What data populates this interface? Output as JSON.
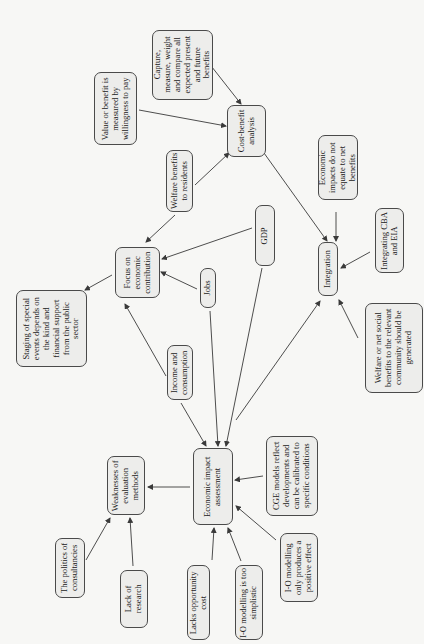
{
  "diagram": {
    "orientation": "rotated-90-ccw",
    "nodes": [
      {
        "id": "capture",
        "label": "Capture, measure, weight and compare all expected present and future benefits",
        "box": [
          152,
          30,
          61,
          70
        ],
        "textw": 62
      },
      {
        "id": "value",
        "label": "Value or benefit is measured by willingness to pay",
        "box": [
          94,
          72,
          43,
          73
        ],
        "textw": 68
      },
      {
        "id": "cba",
        "label": "Cost-benefit analysis",
        "box": [
          227,
          105,
          39,
          52
        ],
        "textw": 46
      },
      {
        "id": "welfare-res",
        "label": "Welfare benefits to residents",
        "box": [
          166,
          150,
          27,
          62
        ],
        "textw": 58
      },
      {
        "id": "econ-impacts",
        "label": "Economic impacts do not equate to net benefits",
        "box": [
          318,
          135,
          40,
          65
        ],
        "textw": 60
      },
      {
        "id": "integrating",
        "label": "Integrating CBA and EIA",
        "box": [
          375,
          208,
          29,
          65
        ],
        "textw": 58
      },
      {
        "id": "gdp",
        "label": "GDP",
        "box": [
          255,
          205,
          20,
          61
        ],
        "textw": 40
      },
      {
        "id": "integration",
        "label": "Integration",
        "box": [
          318,
          242,
          20,
          54
        ],
        "textw": 50
      },
      {
        "id": "focus",
        "label": "Focus on economic contribution",
        "box": [
          115,
          247,
          45,
          51
        ],
        "textw": 48
      },
      {
        "id": "jobs",
        "label": "Jobs",
        "box": [
          200,
          268,
          16,
          40
        ],
        "textw": 36
      },
      {
        "id": "staging",
        "label": "Staging of special events depends on the kind and financial support from the public sector",
        "box": [
          16,
          290,
          71,
          77
        ],
        "textw": 70
      },
      {
        "id": "welfare-net",
        "label": "Welfare or net social benefits to the relevant community should be generated",
        "box": [
          365,
          303,
          58,
          90
        ],
        "textw": 84
      },
      {
        "id": "income",
        "label": "Income and consumption",
        "box": [
          167,
          345,
          26,
          55
        ],
        "textw": 52
      },
      {
        "id": "cge",
        "label": "CGE models reflect developments and can be calibrated to specific conditions",
        "box": [
          266,
          436,
          52,
          80
        ],
        "textw": 76
      },
      {
        "id": "weaknesses",
        "label": "Weaknesses of evaluation methods",
        "box": [
          107,
          456,
          38,
          59
        ],
        "textw": 56
      },
      {
        "id": "eia",
        "label": "Economic impact assessment",
        "box": [
          193,
          448,
          40,
          77
        ],
        "textw": 72
      },
      {
        "id": "politics",
        "label": "The politics of consultancies",
        "box": [
          55,
          538,
          30,
          60
        ],
        "textw": 56
      },
      {
        "id": "io-positive",
        "label": "I-O modelling only produces a positive effect",
        "box": [
          280,
          533,
          38,
          69
        ],
        "textw": 64
      },
      {
        "id": "lack-research",
        "label": "Lack of research",
        "box": [
          120,
          570,
          28,
          58
        ],
        "textw": 50
      },
      {
        "id": "lacks-opp",
        "label": "Lacks opportunity cost",
        "box": [
          187,
          565,
          23,
          75
        ],
        "textw": 72
      },
      {
        "id": "io-simplistic",
        "label": "I-O modelling is too simplistic",
        "box": [
          235,
          565,
          28,
          75
        ],
        "textw": 72
      }
    ],
    "edges": [
      {
        "from": "capture",
        "to": "cba",
        "line": [
          208,
          62,
          241,
          104
        ],
        "arrow": true
      },
      {
        "from": "value",
        "to": "cba",
        "line": [
          139,
          110,
          226,
          126
        ],
        "arrow": true
      },
      {
        "from": "welfare-res",
        "to": "cba",
        "line": [
          195,
          185,
          229,
          153
        ],
        "arrow": true
      },
      {
        "from": "cba",
        "to": "integration",
        "line": [
          264,
          153,
          327,
          241
        ],
        "arrow": true
      },
      {
        "from": "econ-impacts",
        "to": "integration",
        "line": [
          336,
          212,
          336,
          241
        ],
        "arrow": true
      },
      {
        "from": "integrating",
        "to": "integration",
        "line": [
          370,
          252,
          341,
          268
        ],
        "arrow": true
      },
      {
        "from": "welfare-net",
        "to": "integration",
        "line": [
          358,
          338,
          339,
          300
        ],
        "arrow": true
      },
      {
        "from": "eia",
        "to": "integration",
        "line": [
          236,
          420,
          320,
          301
        ],
        "arrow": true
      },
      {
        "from": "welfare-res",
        "to": "focus",
        "line": [
          175,
          215,
          146,
          242
        ],
        "arrow": true
      },
      {
        "from": "gdp",
        "to": "focus",
        "line": [
          252,
          228,
          162,
          259
        ],
        "arrow": true
      },
      {
        "from": "jobs",
        "to": "focus",
        "line": [
          197,
          289,
          161,
          272
        ],
        "arrow": true
      },
      {
        "from": "focus",
        "to": "staging",
        "line": [
          112,
          275,
          85,
          290
        ],
        "arrow": true
      },
      {
        "from": "income",
        "to": "focus",
        "line": [
          166,
          376,
          125,
          304
        ],
        "arrow": true
      },
      {
        "from": "income",
        "to": "eia",
        "line": [
          181,
          403,
          206,
          446
        ],
        "arrow": true
      },
      {
        "from": "jobs",
        "to": "eia",
        "line": [
          210,
          311,
          218,
          446
        ],
        "arrow": true
      },
      {
        "from": "gdp",
        "to": "eia",
        "line": [
          262,
          268,
          226,
          446
        ],
        "arrow": true
      },
      {
        "from": "eia",
        "to": "weaknesses",
        "line": [
          190,
          487,
          148,
          487
        ],
        "arrow": true
      },
      {
        "from": "cge",
        "to": "eia",
        "line": [
          263,
          476,
          235,
          480
        ],
        "arrow": true
      },
      {
        "from": "io-positive",
        "to": "eia",
        "line": [
          276,
          540,
          236,
          506
        ],
        "arrow": true
      },
      {
        "from": "io-simplistic",
        "to": "eia",
        "line": [
          241,
          561,
          228,
          528
        ],
        "arrow": true
      },
      {
        "from": "lacks-opp",
        "to": "eia",
        "line": [
          212,
          560,
          214,
          528
        ],
        "arrow": true
      },
      {
        "from": "lack-research",
        "to": "weaknesses",
        "line": [
          133,
          566,
          130,
          518
        ],
        "arrow": true
      },
      {
        "from": "politics",
        "to": "weaknesses",
        "line": [
          86,
          560,
          110,
          518
        ],
        "arrow": true
      }
    ]
  },
  "colors": {
    "background": "#f7f7f5",
    "node_fill": "#ededeb",
    "node_border": "#4a4a4a",
    "edge": "#3a3a3a",
    "text": "#1a1a1a"
  }
}
